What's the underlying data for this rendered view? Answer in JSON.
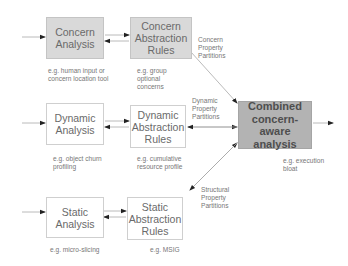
{
  "diagram": {
    "boxes": {
      "concern_analysis": {
        "label": "Concern\nAnalysis",
        "note": "e.g. human input or\nconcern location tool"
      },
      "concern_abstraction": {
        "label": "Concern\nAbstraction\nRules",
        "note": "e.g. group\noptional\nconcerns"
      },
      "dynamic_analysis": {
        "label": "Dynamic\nAnalysis",
        "note": "e.g. object churn\nprofiling"
      },
      "dynamic_abstraction": {
        "label": "Dynamic\nAbstraction\nRules",
        "note": "e.g. cumulative\nresource profile"
      },
      "static_analysis": {
        "label": "Static\nAnalysis",
        "note": "e.g. micro-slicing"
      },
      "static_abstraction": {
        "label": "Static\nAbstraction\nRules",
        "note": "e.g. MSIG"
      },
      "combined": {
        "label": "Combined\nconcern-aware\nanalysis",
        "note": "e.g. execution\nbloat"
      }
    },
    "edge_labels": {
      "concern": "Concern\nProperty\nPartitions",
      "dynamic": "Dynamic\nProperty\nPartitions",
      "structural": "Structural\nProperty\nPartitions"
    },
    "colors": {
      "gray_fill": "#d9d9d9",
      "dark_fill": "#b3b3b3",
      "line": "#9a9a9a"
    }
  }
}
